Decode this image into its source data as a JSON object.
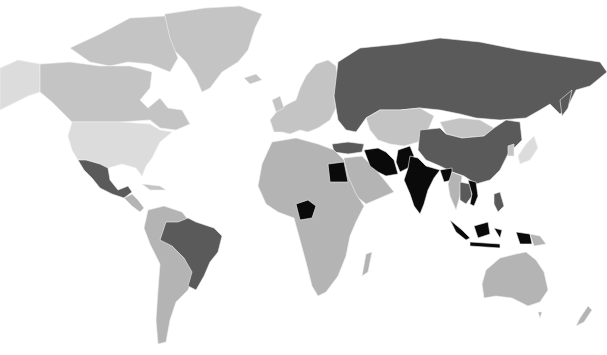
{
  "map": {
    "type": "choropleth",
    "projection": "world",
    "legend": null,
    "title": null,
    "shade_levels": {
      "lightest": "#dcdcdc",
      "light": "#c4c4c4",
      "medium": "#b4b4b4",
      "dark": "#5a5a5a",
      "darkest": "#0a0a0a"
    },
    "regions": [
      {
        "name": "Alaska",
        "shade": "lightest"
      },
      {
        "name": "Canada",
        "shade": "light"
      },
      {
        "name": "Greenland",
        "shade": "light"
      },
      {
        "name": "United States",
        "shade": "lightest"
      },
      {
        "name": "Mexico",
        "shade": "dark"
      },
      {
        "name": "Central America",
        "shade": "medium"
      },
      {
        "name": "Brazil",
        "shade": "dark"
      },
      {
        "name": "South America (other)",
        "shade": "medium"
      },
      {
        "name": "Europe",
        "shade": "light"
      },
      {
        "name": "Russia",
        "shade": "dark"
      },
      {
        "name": "Turkey",
        "shade": "dark"
      },
      {
        "name": "Central Asia",
        "shade": "light"
      },
      {
        "name": "Mongolia",
        "shade": "light"
      },
      {
        "name": "China",
        "shade": "dark"
      },
      {
        "name": "Japan",
        "shade": "lightest"
      },
      {
        "name": "Iran",
        "shade": "darkest"
      },
      {
        "name": "Pakistan",
        "shade": "darkest"
      },
      {
        "name": "India",
        "shade": "darkest"
      },
      {
        "name": "Bangladesh",
        "shade": "darkest"
      },
      {
        "name": "Myanmar",
        "shade": "medium"
      },
      {
        "name": "Thailand",
        "shade": "dark"
      },
      {
        "name": "Vietnam",
        "shade": "darkest"
      },
      {
        "name": "Philippines",
        "shade": "dark"
      },
      {
        "name": "Indonesia",
        "shade": "dark"
      },
      {
        "name": "Papua New Guinea",
        "shade": "medium"
      },
      {
        "name": "Egypt",
        "shade": "darkest"
      },
      {
        "name": "Nigeria",
        "shade": "darkest"
      },
      {
        "name": "Africa (other)",
        "shade": "medium"
      },
      {
        "name": "Middle East (other)",
        "shade": "medium"
      },
      {
        "name": "Madagascar",
        "shade": "medium"
      },
      {
        "name": "Australia",
        "shade": "medium"
      },
      {
        "name": "New Zealand",
        "shade": "medium"
      }
    ]
  }
}
